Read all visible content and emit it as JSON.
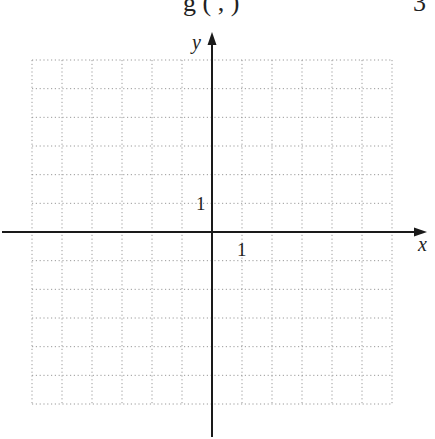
{
  "header": {
    "cutoff_text_left": "g (  ,  )",
    "cutoff_text_right": "3"
  },
  "chart_data": {
    "type": "grid",
    "title": "",
    "xlabel": "x",
    "ylabel": "y",
    "x_tick_labels": [
      {
        "value": 1,
        "label": "1"
      }
    ],
    "y_tick_labels": [
      {
        "value": 1,
        "label": "1"
      }
    ],
    "xlim": [
      -6,
      6
    ],
    "ylim": [
      -6,
      6
    ],
    "grid": true,
    "grid_style": "dotted",
    "series": []
  },
  "graph": {
    "x_axis_label": "x",
    "y_axis_label": "y",
    "x_tick_one": "1",
    "y_tick_one": "1",
    "colors": {
      "axis": "#1a1a1a",
      "grid": "#9a9a9a",
      "text": "#222222"
    }
  }
}
